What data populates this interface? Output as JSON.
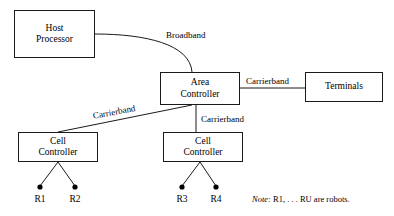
{
  "diagram": {
    "nodes": [
      {
        "id": "host-processor",
        "lines": [
          "Host",
          "Processor"
        ]
      },
      {
        "id": "area-controller",
        "lines": [
          "Area",
          "Controller"
        ]
      },
      {
        "id": "terminals",
        "lines": [
          "Terminals"
        ]
      },
      {
        "id": "cell-controller-left",
        "lines": [
          "Cell",
          "Controller"
        ]
      },
      {
        "id": "cell-controller-right",
        "lines": [
          "Cell",
          "Controller"
        ]
      }
    ],
    "edge_labels": {
      "broadband": "Broadband",
      "carrierband_terminals": "Carrierband",
      "carrierband_cell_left": "Carrierband",
      "carrierband_cell_right": "Carrierband"
    },
    "robots": [
      {
        "id": "r1",
        "label": "R1"
      },
      {
        "id": "r2",
        "label": "R2"
      },
      {
        "id": "r3",
        "label": "R3"
      },
      {
        "id": "r4",
        "label": "R4"
      }
    ],
    "note": {
      "keyword": "Note:",
      "text": "R1, . . . RU are robots."
    },
    "colors": {
      "stroke": "#1a1a1a",
      "background": "#ffffff",
      "text": "#000000"
    }
  }
}
